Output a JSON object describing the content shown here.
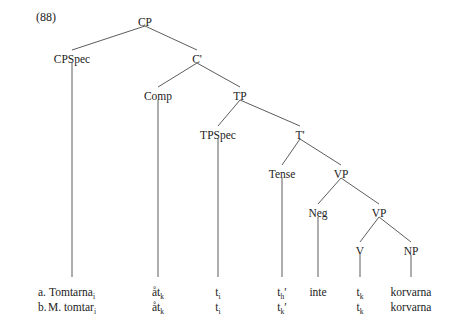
{
  "figure": {
    "example_number": "(88)",
    "width": 454,
    "height": 328,
    "ink_color": "#1c1c1c",
    "line_color": "#4a4a4a",
    "background": "#ffffff"
  },
  "tree": {
    "nodes": [
      {
        "id": "CP",
        "label": "CP",
        "x": 145,
        "y": 22
      },
      {
        "id": "CPSpec",
        "label": "CPSpec",
        "x": 72,
        "y": 59
      },
      {
        "id": "Cbar",
        "label": "C'",
        "x": 197,
        "y": 59
      },
      {
        "id": "Comp",
        "label": "Comp",
        "x": 158,
        "y": 96
      },
      {
        "id": "TP",
        "label": "TP",
        "x": 240,
        "y": 96
      },
      {
        "id": "TPSpec",
        "label": "TPSpec",
        "x": 218,
        "y": 135
      },
      {
        "id": "Tbar",
        "label": "T'",
        "x": 300,
        "y": 135
      },
      {
        "id": "Tense",
        "label": "Tense",
        "x": 282,
        "y": 174
      },
      {
        "id": "VP1",
        "label": "VP",
        "x": 341,
        "y": 174
      },
      {
        "id": "Neg",
        "label": "Neg",
        "x": 318,
        "y": 213
      },
      {
        "id": "VP2",
        "label": "VP",
        "x": 379,
        "y": 213
      },
      {
        "id": "V",
        "label": "V",
        "x": 360,
        "y": 251
      },
      {
        "id": "NP",
        "label": "NP",
        "x": 411,
        "y": 251
      }
    ],
    "edges": [
      {
        "from": "CP",
        "to": "CPSpec"
      },
      {
        "from": "CP",
        "to": "Cbar"
      },
      {
        "from": "Cbar",
        "to": "Comp"
      },
      {
        "from": "Cbar",
        "to": "TP"
      },
      {
        "from": "TP",
        "to": "TPSpec"
      },
      {
        "from": "TP",
        "to": "Tbar"
      },
      {
        "from": "Tbar",
        "to": "Tense"
      },
      {
        "from": "Tbar",
        "to": "VP1"
      },
      {
        "from": "VP1",
        "to": "Neg"
      },
      {
        "from": "VP1",
        "to": "VP2"
      },
      {
        "from": "VP2",
        "to": "V"
      },
      {
        "from": "VP2",
        "to": "NP"
      }
    ],
    "stems": [
      {
        "from": "CPSpec",
        "x": 72,
        "y_top": 63,
        "y_bottom": 277
      },
      {
        "from": "Comp",
        "x": 158,
        "y_top": 100,
        "y_bottom": 277
      },
      {
        "from": "TPSpec",
        "x": 218,
        "y_top": 139,
        "y_bottom": 277
      },
      {
        "from": "Tense",
        "x": 282,
        "y_top": 178,
        "y_bottom": 277
      },
      {
        "from": "Neg",
        "x": 318,
        "y_top": 217,
        "y_bottom": 277
      },
      {
        "from": "V",
        "x": 360,
        "y_top": 255,
        "y_bottom": 277
      },
      {
        "from": "NP",
        "x": 411,
        "y_top": 255,
        "y_bottom": 277
      }
    ]
  },
  "rows": [
    {
      "marker": "a.",
      "marker_x": 38,
      "y": 286,
      "terminals": [
        {
          "column": "CPSpec",
          "x": 72,
          "text": "Tomtarna",
          "sub": "i",
          "prime": ""
        },
        {
          "column": "Comp",
          "x": 158,
          "text": "åt",
          "sub": "k",
          "prime": ""
        },
        {
          "column": "TPSpec",
          "x": 218,
          "text": "t",
          "sub": "i",
          "prime": ""
        },
        {
          "column": "Tense",
          "x": 282,
          "text": "t",
          "sub": "h",
          "prime": "′"
        },
        {
          "column": "Neg",
          "x": 318,
          "text": "inte",
          "sub": "",
          "prime": ""
        },
        {
          "column": "V",
          "x": 360,
          "text": "t",
          "sub": "k",
          "prime": ""
        },
        {
          "column": "NP",
          "x": 411,
          "text": "korvarna",
          "sub": "",
          "prime": ""
        }
      ]
    },
    {
      "marker": "b.",
      "marker_x": 38,
      "y": 301,
      "terminals": [
        {
          "column": "CPSpec",
          "x": 72,
          "text": "M. tomtar",
          "sub": "i",
          "prime": ""
        },
        {
          "column": "Comp",
          "x": 158,
          "text": "åt",
          "sub": "k",
          "prime": ""
        },
        {
          "column": "TPSpec",
          "x": 218,
          "text": "t",
          "sub": "i",
          "prime": ""
        },
        {
          "column": "Tense",
          "x": 282,
          "text": "t",
          "sub": "k",
          "prime": "′"
        },
        {
          "column": "Neg",
          "x": 318,
          "text": "",
          "sub": "",
          "prime": ""
        },
        {
          "column": "V",
          "x": 360,
          "text": "t",
          "sub": "k",
          "prime": ""
        },
        {
          "column": "NP",
          "x": 411,
          "text": "korvarna",
          "sub": "",
          "prime": ""
        }
      ]
    }
  ]
}
